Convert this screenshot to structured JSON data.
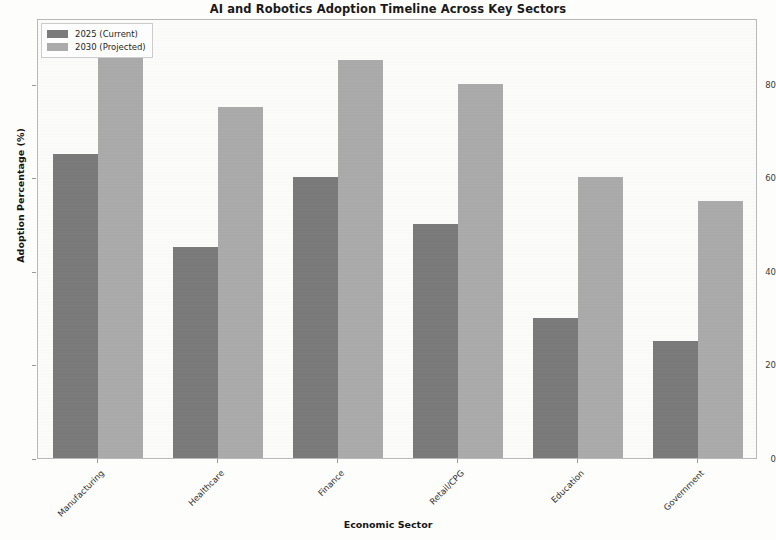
{
  "chart_data": {
    "type": "bar",
    "title": "AI and Robotics Adoption Timeline Across Key Sectors",
    "xlabel": "Economic Sector",
    "ylabel": "Adoption Percentage (%)",
    "categories": [
      "Manufacturing",
      "Healthcare",
      "Finance",
      "Retail/CPG",
      "Education",
      "Government"
    ],
    "series": [
      {
        "name": "2025 (Current)",
        "color": "#7b7b7b",
        "values": [
          65,
          45,
          60,
          50,
          30,
          25
        ]
      },
      {
        "name": "2030 (Projected)",
        "color": "#ababab",
        "values": [
          90,
          75,
          85,
          80,
          60,
          55
        ]
      }
    ],
    "ylim": [
      0,
      94
    ],
    "yticks": [
      0,
      20,
      40,
      60,
      80
    ],
    "ytick_labels": [
      "0",
      "20",
      "40",
      "60",
      "80"
    ],
    "grid": false,
    "legend_position": "upper left",
    "xtick_rotation": -45
  }
}
